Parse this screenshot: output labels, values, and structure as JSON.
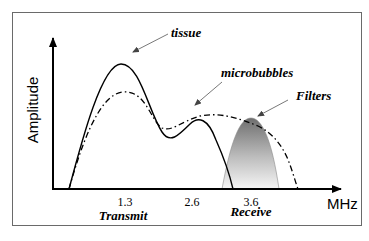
{
  "diagram": {
    "y_axis_label": "Amplitude",
    "x_axis_unit": "MHz",
    "x_ticks": [
      {
        "label": "1.3",
        "x": 125
      },
      {
        "label": "2.6",
        "x": 192
      },
      {
        "label": "3.6",
        "x": 251
      }
    ],
    "band_labels": {
      "transmit": "Transmit",
      "receive": "Receive"
    },
    "annotations": {
      "tissue": "tissue",
      "microbubbles": "microbubbles",
      "filters": "Filters"
    },
    "series": [
      {
        "name": "tissue",
        "style": "solid",
        "description": "Tissue echo spectrum: large peak near 1.3 MHz, smaller peak near 2.6 MHz"
      },
      {
        "name": "microbubbles",
        "style": "dash-dot",
        "description": "Microbubble echo spectrum: peak near 1.3 MHz, broad harmonic shoulder extending past 3.6 MHz"
      },
      {
        "name": "Filters",
        "style": "gradient-fill",
        "description": "Receive filter band centered near 3.6 MHz"
      }
    ],
    "colors": {
      "frame": "#6a6a6a",
      "axis": "#000000",
      "filter_top": "#6e6e6e",
      "filter_bottom": "#f4f4f4",
      "arrow": "#555555"
    }
  }
}
